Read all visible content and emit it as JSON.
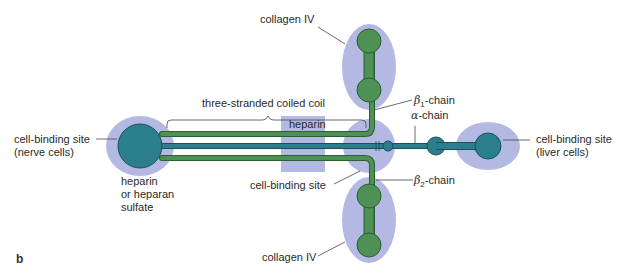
{
  "figure": {
    "panel_label": "b",
    "colors": {
      "halo": "#b3b9e3",
      "beta_chain_fill": "#4f9154",
      "beta_chain_stroke": "#2b5e32",
      "alpha_chain_fill": "#2b7f8c",
      "alpha_chain_stroke": "#1c4f5e",
      "heparin_box": "#b3b9e3",
      "leader_line": "#444444"
    },
    "labels": {
      "collagen_top": "collagen IV",
      "coiled_coil": "three-stranded coiled coil",
      "beta1": "-chain",
      "beta1_symbol": "β",
      "beta1_sub": "1",
      "alpha": "-chain",
      "alpha_symbol": "α",
      "heparin_box": "heparin",
      "nerve_line1": "cell-binding site",
      "nerve_line2": "(nerve cells)",
      "heparan_line1": "heparin",
      "heparan_line2": "or heparan",
      "heparan_line3": "sulfate",
      "center_binding": "cell-binding site",
      "beta2": "-chain",
      "beta2_symbol": "β",
      "beta2_sub": "2",
      "liver_line1": "cell-binding site",
      "liver_line2": "(liver cells)",
      "collagen_bottom": "collagen IV"
    }
  }
}
